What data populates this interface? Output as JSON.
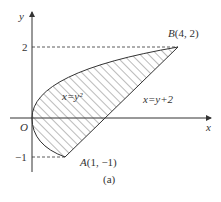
{
  "axes": {
    "x_label": "x",
    "y_label": "y",
    "origin_label": "O"
  },
  "ticks": {
    "y_pos": "2",
    "y_neg": "−1"
  },
  "points": {
    "A": {
      "name": "A",
      "coords": "(1, −1)"
    },
    "B": {
      "name": "B",
      "coords": "(4, 2)"
    }
  },
  "curves": {
    "parabola": "x=y²",
    "line": "x=y+2"
  },
  "caption": "(a)",
  "colors": {
    "stroke": "#333333",
    "hatch": "#555555"
  }
}
